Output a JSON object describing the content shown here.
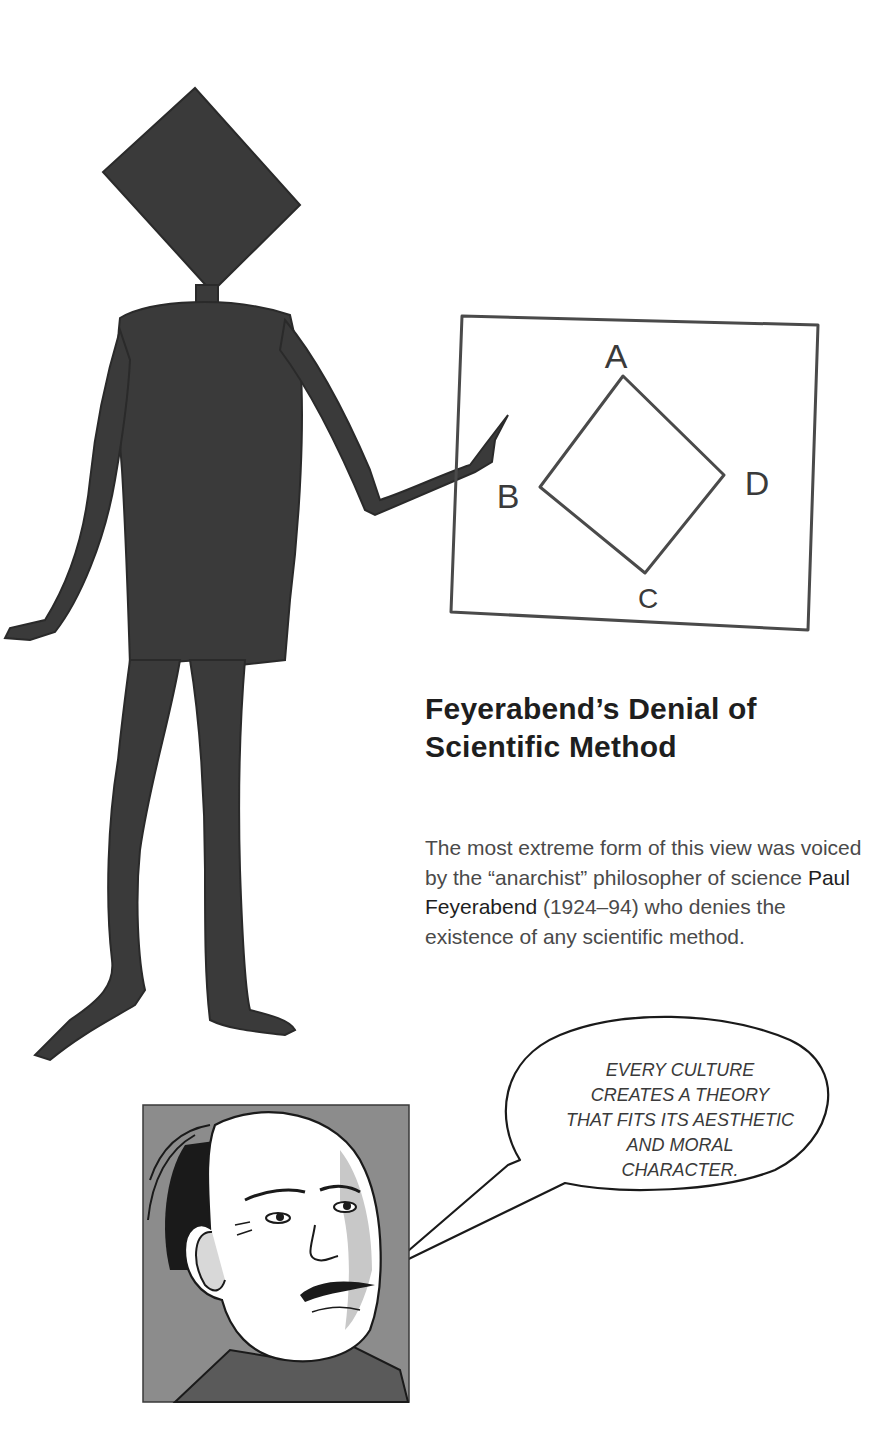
{
  "page": {
    "heading_line1": "Feyerabend’s Denial of",
    "heading_line2": "Scientific Method",
    "body": {
      "part1": "The most extreme form of this view was voiced by the “anarchist” philosopher of science ",
      "name": "Paul Feyerabend",
      "part2": " (1924–94) who denies the existence of any scientific method."
    }
  },
  "illustration": {
    "board_labels": {
      "a": "A",
      "b": "B",
      "c": "C",
      "d": "D"
    },
    "colors": {
      "figure": "#3a3a3a",
      "portrait_bg": "#8c8c8c",
      "ink": "#1a1a1a"
    }
  },
  "speech_bubble": {
    "lines": [
      "EVERY CULTURE",
      "CREATES A THEORY",
      "THAT FITS ITS AESTHETIC",
      "AND MORAL",
      "CHARACTER."
    ]
  }
}
